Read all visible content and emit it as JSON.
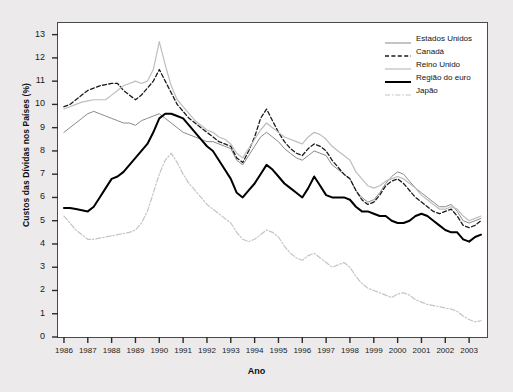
{
  "chart_data": {
    "type": "line",
    "title": "",
    "xlabel": "Ano",
    "ylabel": "Custos das Dívidas nos Países (%)",
    "xlim": [
      1985.75,
      2003.75
    ],
    "ylim": [
      0,
      13.5
    ],
    "ytick_labels": [
      "0",
      "1",
      "2",
      "3",
      "4",
      "5",
      "6",
      "7",
      "8",
      "9",
      "10",
      "11",
      "12",
      "13"
    ],
    "ytick_values": [
      0,
      1,
      2,
      3,
      4,
      5,
      6,
      7,
      8,
      9,
      10,
      11,
      12,
      13
    ],
    "xtick_labels": [
      "1986",
      "1987",
      "1988",
      "1989",
      "1990",
      "1991",
      "1992",
      "1993",
      "1994",
      "1995",
      "1996",
      "1997",
      "1998",
      "1999",
      "2000",
      "2001",
      "2002",
      "2003"
    ],
    "xtick_values": [
      1986,
      1987,
      1988,
      1989,
      1990,
      1991,
      1992,
      1993,
      1994,
      1995,
      1996,
      1997,
      1998,
      1999,
      2000,
      2001,
      2002,
      2003
    ],
    "grid": false,
    "legend_position": "top-right",
    "x": [
      1986.0,
      1986.25,
      1986.5,
      1986.75,
      1987.0,
      1987.25,
      1987.5,
      1987.75,
      1988.0,
      1988.25,
      1988.5,
      1988.75,
      1989.0,
      1989.25,
      1989.5,
      1989.75,
      1990.0,
      1990.25,
      1990.5,
      1990.75,
      1991.0,
      1991.25,
      1991.5,
      1991.75,
      1992.0,
      1992.25,
      1992.5,
      1992.75,
      1993.0,
      1993.25,
      1993.5,
      1993.75,
      1994.0,
      1994.25,
      1994.5,
      1994.75,
      1995.0,
      1995.25,
      1995.5,
      1995.75,
      1996.0,
      1996.25,
      1996.5,
      1996.75,
      1997.0,
      1997.25,
      1997.5,
      1997.75,
      1998.0,
      1998.25,
      1998.5,
      1998.75,
      1999.0,
      1999.25,
      1999.5,
      1999.75,
      2000.0,
      2000.25,
      2000.5,
      2000.75,
      2001.0,
      2001.25,
      2001.5,
      2001.75,
      2002.0,
      2002.25,
      2002.5,
      2002.75,
      2003.0,
      2003.25,
      2003.5
    ],
    "series": [
      {
        "name": "Estados Unidos",
        "color": "#8a8a8a",
        "style": "solid",
        "width": 1.0,
        "values": [
          8.8,
          9.0,
          9.2,
          9.4,
          9.6,
          9.7,
          9.6,
          9.5,
          9.4,
          9.3,
          9.2,
          9.2,
          9.1,
          9.3,
          9.4,
          9.5,
          9.6,
          9.4,
          9.2,
          9.0,
          8.8,
          8.7,
          8.6,
          8.5,
          8.4,
          8.4,
          8.3,
          8.2,
          8.1,
          7.6,
          7.4,
          7.8,
          8.2,
          8.6,
          8.8,
          8.6,
          8.4,
          8.1,
          7.9,
          7.7,
          7.6,
          7.8,
          8.0,
          7.9,
          7.8,
          7.4,
          7.2,
          7.0,
          6.8,
          6.3,
          6.0,
          5.8,
          5.9,
          6.2,
          6.6,
          6.9,
          7.1,
          7.0,
          6.7,
          6.4,
          6.2,
          6.0,
          5.8,
          5.6,
          5.6,
          5.7,
          5.4,
          5.0,
          4.9,
          5.0,
          5.1
        ]
      },
      {
        "name": "Canadá",
        "color": "#1a1a1a",
        "style": "dashed",
        "width": 1.3,
        "values": [
          9.9,
          10.0,
          10.2,
          10.4,
          10.6,
          10.7,
          10.8,
          10.85,
          10.9,
          10.9,
          10.6,
          10.4,
          10.2,
          10.4,
          10.7,
          11.0,
          11.5,
          11.0,
          10.5,
          10.0,
          9.7,
          9.4,
          9.2,
          9.0,
          8.8,
          8.6,
          8.4,
          8.3,
          8.2,
          7.7,
          7.5,
          8.0,
          8.6,
          9.4,
          9.8,
          9.3,
          8.8,
          8.4,
          8.1,
          7.9,
          7.8,
          8.1,
          8.3,
          8.2,
          8.0,
          7.6,
          7.3,
          7.0,
          6.8,
          6.3,
          5.9,
          5.7,
          5.8,
          6.1,
          6.5,
          6.7,
          6.8,
          6.6,
          6.3,
          6.0,
          5.8,
          5.6,
          5.4,
          5.3,
          5.4,
          5.5,
          5.2,
          4.8,
          4.7,
          4.8,
          5.0
        ]
      },
      {
        "name": "Reino Unido",
        "color": "#bdbdbd",
        "style": "solid",
        "width": 1.2,
        "values": [
          9.8,
          9.9,
          10.0,
          10.1,
          10.15,
          10.2,
          10.2,
          10.2,
          10.4,
          10.6,
          10.8,
          10.9,
          11.0,
          10.9,
          11.0,
          11.5,
          12.7,
          11.7,
          10.8,
          10.2,
          9.9,
          9.6,
          9.3,
          9.1,
          8.9,
          8.8,
          8.6,
          8.5,
          8.3,
          7.9,
          7.7,
          8.1,
          8.5,
          8.9,
          9.2,
          9.0,
          8.8,
          8.6,
          8.5,
          8.4,
          8.3,
          8.6,
          8.8,
          8.7,
          8.5,
          8.2,
          8.0,
          7.8,
          7.6,
          7.1,
          6.8,
          6.5,
          6.4,
          6.5,
          6.7,
          6.8,
          6.9,
          6.8,
          6.6,
          6.4,
          6.1,
          5.9,
          5.7,
          5.5,
          5.5,
          5.6,
          5.5,
          5.2,
          5.0,
          5.1,
          5.2
        ]
      },
      {
        "name": "Região do euro",
        "color": "#000000",
        "style": "solid",
        "width": 2.0,
        "values": [
          5.55,
          5.55,
          5.5,
          5.45,
          5.4,
          5.6,
          6.0,
          6.4,
          6.8,
          6.9,
          7.1,
          7.4,
          7.7,
          8.0,
          8.3,
          8.8,
          9.4,
          9.6,
          9.6,
          9.5,
          9.4,
          9.1,
          8.8,
          8.5,
          8.2,
          8.0,
          7.6,
          7.2,
          6.8,
          6.2,
          6.0,
          6.3,
          6.6,
          7.0,
          7.4,
          7.2,
          6.9,
          6.6,
          6.4,
          6.2,
          6.0,
          6.4,
          6.9,
          6.5,
          6.1,
          6.0,
          6.0,
          6.0,
          5.9,
          5.6,
          5.4,
          5.4,
          5.3,
          5.2,
          5.2,
          5.0,
          4.9,
          4.9,
          5.0,
          5.2,
          5.3,
          5.2,
          5.0,
          4.8,
          4.6,
          4.5,
          4.5,
          4.2,
          4.1,
          4.3,
          4.4
        ]
      },
      {
        "name": "Japão",
        "color": "#c4c4c4",
        "style": "dashdot",
        "width": 1.2,
        "values": [
          5.2,
          4.9,
          4.6,
          4.4,
          4.2,
          4.2,
          4.25,
          4.3,
          4.35,
          4.4,
          4.45,
          4.5,
          4.6,
          4.9,
          5.4,
          6.2,
          7.0,
          7.6,
          7.9,
          7.5,
          7.0,
          6.6,
          6.3,
          6.0,
          5.7,
          5.5,
          5.3,
          5.1,
          4.9,
          4.5,
          4.2,
          4.1,
          4.2,
          4.4,
          4.6,
          4.5,
          4.3,
          3.9,
          3.6,
          3.4,
          3.3,
          3.5,
          3.6,
          3.4,
          3.2,
          3.0,
          3.1,
          3.2,
          3.0,
          2.6,
          2.3,
          2.1,
          2.0,
          1.9,
          1.8,
          1.7,
          1.85,
          1.9,
          1.8,
          1.6,
          1.5,
          1.4,
          1.35,
          1.3,
          1.25,
          1.2,
          1.1,
          0.9,
          0.75,
          0.65,
          0.7
        ]
      }
    ]
  },
  "legend": {
    "entries": [
      {
        "label": "Estados Unidos"
      },
      {
        "label": "Canadá"
      },
      {
        "label": "Reino Unido"
      },
      {
        "label": "Região do euro"
      },
      {
        "label": "Japão"
      }
    ]
  }
}
